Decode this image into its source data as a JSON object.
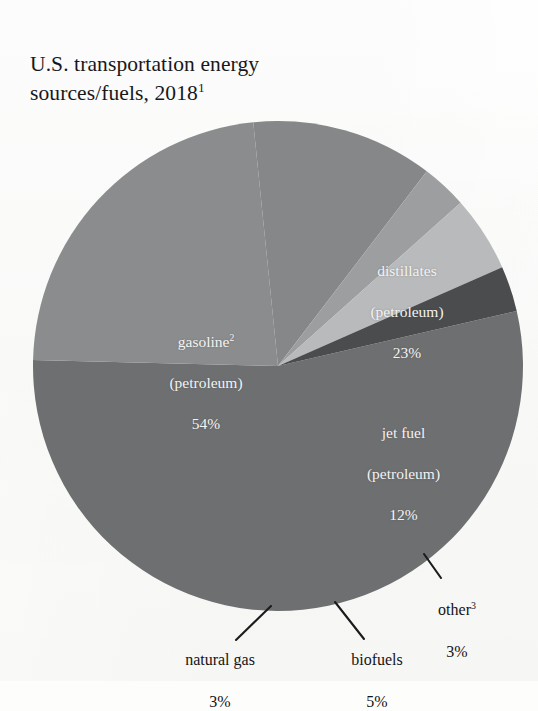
{
  "chart_data": {
    "type": "pie",
    "title": "U.S. transportation energy\nsources/fuels, 2018",
    "title_footnote": "1",
    "categories": [
      "gasoline (petroleum)",
      "distillates (petroleum)",
      "jet fuel (petroleum)",
      "other",
      "biofuels",
      "natural gas"
    ],
    "values": [
      54,
      23,
      12,
      3,
      5,
      3
    ],
    "unit": "%",
    "xlabel": "",
    "ylabel": "",
    "legend": "none (labels on slices)",
    "grid": false,
    "slices": [
      {
        "name": "gasoline",
        "footnote": "2",
        "sub": "(petroleum)",
        "value": 54,
        "value_text": "54%",
        "color": "#6e6f70",
        "label_position": "inside",
        "label_x": 131,
        "label_y": 311,
        "label_w": 150
      },
      {
        "name": "distillates",
        "footnote": "",
        "sub": "(petroleum)",
        "value": 23,
        "value_text": "23%",
        "color": "#8b8c8d",
        "label_position": "inside",
        "label_x": 337,
        "label_y": 240,
        "label_w": 140
      },
      {
        "name": "jet fuel",
        "footnote": "",
        "sub": "(petroleum)",
        "value": 12,
        "value_text": "12%",
        "color": "#868788",
        "label_position": "inside",
        "label_x": 336,
        "label_y": 402,
        "label_w": 135
      },
      {
        "name": "other",
        "footnote": "3",
        "sub": "",
        "value": 3,
        "value_text": "3%",
        "color": "#9d9e9f",
        "label_position": "outside",
        "label_x": 412,
        "label_y": 578,
        "label_w": 90
      },
      {
        "name": "biofuels",
        "footnote": "",
        "sub": "",
        "value": 5,
        "value_text": "5%",
        "color": "#b9babb",
        "label_position": "outside",
        "label_x": 327,
        "label_y": 628,
        "label_w": 100
      },
      {
        "name": "natural gas",
        "footnote": "",
        "sub": "",
        "value": 3,
        "value_text": "3%",
        "color": "#4b4c4d",
        "label_position": "outside",
        "label_x": 160,
        "label_y": 628,
        "label_w": 120
      }
    ],
    "geometry": {
      "center_x": 278,
      "center_y": 366,
      "radius": 245,
      "start_angle_deg": -13
    },
    "colors": {
      "background": "#fdfdfc",
      "text": "#141416",
      "slice_label_text": "#f3f3f3",
      "leader_line": "#1b1b1d"
    }
  }
}
